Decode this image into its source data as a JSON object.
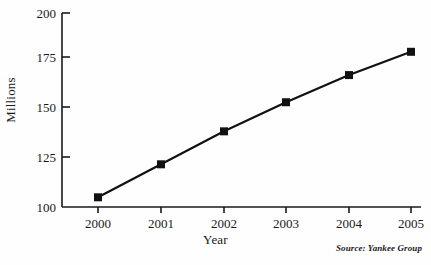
{
  "chart_data": {
    "type": "line",
    "title": "",
    "xlabel": "Year",
    "ylabel": "Millions",
    "categories": [
      "2000",
      "2001",
      "2002",
      "2003",
      "2004",
      "2005"
    ],
    "x": [
      2000,
      2001,
      2002,
      2003,
      2004,
      2005
    ],
    "values": [
      105,
      122,
      139,
      154,
      168,
      180
    ],
    "series": [
      {
        "name": "Millions",
        "values": [
          105,
          122,
          139,
          154,
          168,
          180
        ]
      }
    ],
    "ylim": [
      100,
      200
    ],
    "yticks": [
      100,
      125,
      150,
      175,
      200
    ],
    "ytick_labels": [
      "100",
      "125",
      "150",
      "175",
      "200"
    ],
    "xtick_labels": [
      "2000",
      "2001",
      "2002",
      "2003",
      "2004",
      "2005"
    ],
    "grid": false,
    "legend": false,
    "legend_position": "none",
    "marker": "square",
    "line_color": "#111111",
    "marker_color": "#111111",
    "background_color": "#fefefe",
    "annotations": [
      "Source: Yankee Group"
    ]
  },
  "figure": {
    "source_note": "Source: Yankee Group"
  }
}
